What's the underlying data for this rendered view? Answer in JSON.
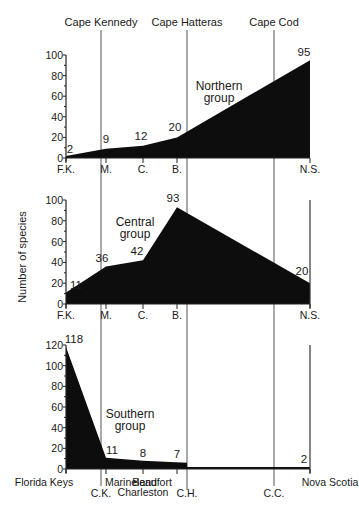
{
  "header": {
    "landmarks": [
      {
        "label": "Cape Kennedy",
        "x": 101
      },
      {
        "label": "Cape Hatteras",
        "x": 187
      },
      {
        "label": "Cape Cod",
        "x": 274
      }
    ]
  },
  "ylabel": "Number of species",
  "chart_data": [
    {
      "type": "area",
      "title": "Northern group",
      "categories": [
        "F.K.",
        "M.",
        "C.",
        "B.",
        "N.S."
      ],
      "values": [
        2,
        9,
        12,
        20,
        95
      ],
      "ylabel": "Number of species",
      "yticks": [
        0,
        20,
        40,
        60,
        80,
        100
      ],
      "ylim": [
        0,
        100
      ]
    },
    {
      "type": "area",
      "title": "Central group",
      "categories": [
        "F.K.",
        "M.",
        "C.",
        "B.",
        "N.S."
      ],
      "values": [
        11,
        36,
        42,
        93,
        20
      ],
      "ylabel": "Number of species",
      "yticks": [
        0,
        20,
        40,
        60,
        80,
        100
      ],
      "ylim": [
        0,
        100
      ]
    },
    {
      "type": "area",
      "title": "Southern group",
      "categories": [
        "Florida Keys",
        "Marineland",
        "Charleston",
        "Beaufort",
        "Nova Scotia"
      ],
      "values": [
        118,
        11,
        8,
        7,
        2
      ],
      "ylabel": "Number of species",
      "yticks": [
        0,
        20,
        40,
        60,
        80,
        100,
        120
      ],
      "ylim": [
        0,
        120
      ],
      "extra_xlabels": [
        "C.K.",
        "C.H.",
        "C.C."
      ]
    }
  ],
  "labels": {
    "northern_title_1": "Northern",
    "northern_title_2": "group",
    "central_title_1": "Central",
    "central_title_2": "group",
    "southern_title_1": "Southern",
    "southern_title_2": "group",
    "ck": "C.K.",
    "ch": "C.H.",
    "cc": "C.C."
  }
}
